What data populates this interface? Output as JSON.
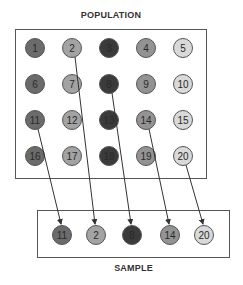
{
  "population": {
    "title": "POPULATION",
    "columns_color": [
      "#6b6b6b",
      "#a3a3a3",
      "#3b3b3b",
      "#939393",
      "#d9d9d9"
    ],
    "items": [
      {
        "label": "1",
        "col": 0,
        "row": 0
      },
      {
        "label": "2",
        "col": 1,
        "row": 0
      },
      {
        "label": "3",
        "col": 2,
        "row": 0
      },
      {
        "label": "4",
        "col": 3,
        "row": 0
      },
      {
        "label": "5",
        "col": 4,
        "row": 0
      },
      {
        "label": "6",
        "col": 0,
        "row": 1
      },
      {
        "label": "7",
        "col": 1,
        "row": 1
      },
      {
        "label": "8",
        "col": 2,
        "row": 1
      },
      {
        "label": "9",
        "col": 3,
        "row": 1
      },
      {
        "label": "10",
        "col": 4,
        "row": 1
      },
      {
        "label": "11",
        "col": 0,
        "row": 2
      },
      {
        "label": "12",
        "col": 1,
        "row": 2
      },
      {
        "label": "13",
        "col": 2,
        "row": 2
      },
      {
        "label": "14",
        "col": 3,
        "row": 2
      },
      {
        "label": "15",
        "col": 4,
        "row": 2
      },
      {
        "label": "16",
        "col": 0,
        "row": 3
      },
      {
        "label": "17",
        "col": 1,
        "row": 3
      },
      {
        "label": "18",
        "col": 2,
        "row": 3
      },
      {
        "label": "19",
        "col": 3,
        "row": 3
      },
      {
        "label": "20",
        "col": 4,
        "row": 3
      }
    ]
  },
  "sample": {
    "title": "SAMPLE",
    "items": [
      {
        "label": "11",
        "from": "11",
        "col": 0
      },
      {
        "label": "2",
        "from": "2",
        "col": 1
      },
      {
        "label": "8",
        "from": "8",
        "col": 2
      },
      {
        "label": "14",
        "from": "14",
        "col": 3
      },
      {
        "label": "20",
        "from": "20",
        "col": 4
      }
    ]
  },
  "colors": {
    "border": "#555555",
    "text": "#2a2a2a",
    "arrow": "#333333"
  }
}
